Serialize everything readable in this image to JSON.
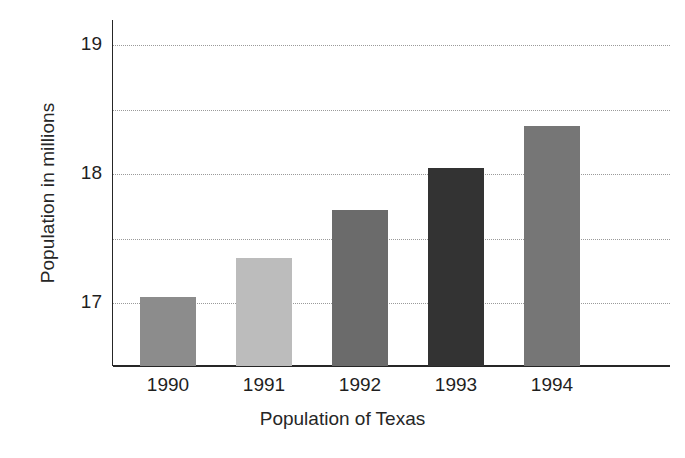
{
  "chart_data": {
    "type": "bar",
    "title": "",
    "xlabel": "Population of Texas",
    "ylabel": "Population in millions",
    "categories": [
      "1990",
      "1991",
      "1992",
      "1993",
      "1994"
    ],
    "values": [
      17.05,
      17.35,
      17.72,
      18.05,
      18.37
    ],
    "series": [
      {
        "name": "Population of Texas",
        "values": [
          17.05,
          17.35,
          17.72,
          18.05,
          18.37
        ]
      }
    ],
    "bar_colors": [
      "#8c8c8c",
      "#bcbcbc",
      "#6b6b6b",
      "#333333",
      "#767676"
    ],
    "ylim": [
      16.6,
      19.1
    ],
    "y_tick_labels": [
      "19",
      "18",
      "17"
    ],
    "y_tick_values": [
      19,
      18,
      17
    ],
    "gridline_values": [
      19,
      18.5,
      18,
      17.5,
      17
    ],
    "grid": true,
    "grid_style": "dotted",
    "legend": "none",
    "axis_color": "#262626",
    "grid_color": "#9a9a9a",
    "background": "#ffffff"
  },
  "axes": {
    "y_title": "Population in millions",
    "x_title": "Population of Texas"
  }
}
